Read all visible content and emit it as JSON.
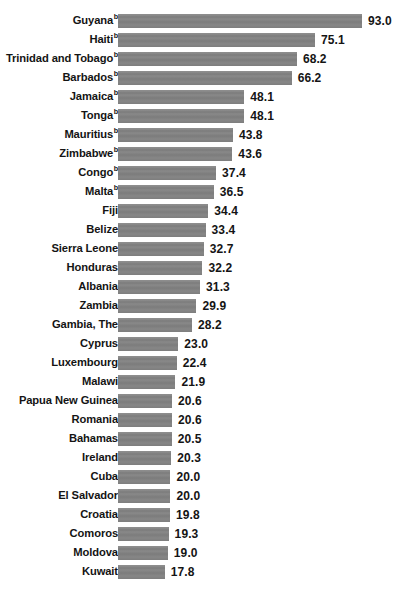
{
  "chart_data": {
    "type": "bar",
    "orientation": "horizontal",
    "title": "",
    "subtitle": "",
    "xlabel": "",
    "ylabel": "",
    "grid": false,
    "legend": null,
    "xlim": [
      0,
      93.0
    ],
    "value_format": "one-decimal",
    "bar_color": "#808080",
    "label_color": "#141414",
    "footnote_marker": "b",
    "categories": [
      "Guyana",
      "Haiti",
      "Trinidad and Tobago",
      "Barbados",
      "Jamaica",
      "Tonga",
      "Mauritius",
      "Zimbabwe",
      "Congo",
      "Malta",
      "Fiji",
      "Belize",
      "Sierra Leone",
      "Honduras",
      "Albania",
      "Zambia",
      "Gambia, The",
      "Cyprus",
      "Luxembourg",
      "Malawi",
      "Papua New Guinea",
      "Romania",
      "Bahamas",
      "Ireland",
      "Cuba",
      "El Salvador",
      "Croatia",
      "Comoros",
      "Moldova",
      "Kuwait"
    ],
    "values": [
      93.0,
      75.1,
      68.2,
      66.2,
      48.1,
      48.1,
      43.8,
      43.6,
      37.4,
      36.5,
      34.4,
      33.4,
      32.7,
      32.2,
      31.3,
      29.9,
      28.2,
      23.0,
      22.4,
      21.9,
      20.6,
      20.6,
      20.5,
      20.3,
      20.0,
      20.0,
      19.8,
      19.3,
      19.0,
      17.8
    ],
    "marked": [
      true,
      true,
      true,
      true,
      true,
      true,
      true,
      true,
      true,
      true,
      false,
      false,
      false,
      false,
      false,
      false,
      false,
      false,
      false,
      false,
      false,
      false,
      false,
      false,
      false,
      false,
      false,
      false,
      false,
      false
    ],
    "rows": [
      {
        "label": "Guyana",
        "value": 93.0,
        "value_text": "93.0",
        "marker": "b"
      },
      {
        "label": "Haiti",
        "value": 75.1,
        "value_text": "75.1",
        "marker": "b"
      },
      {
        "label": "Trinidad and Tobago",
        "value": 68.2,
        "value_text": "68.2",
        "marker": "b"
      },
      {
        "label": "Barbados",
        "value": 66.2,
        "value_text": "66.2",
        "marker": "b"
      },
      {
        "label": "Jamaica",
        "value": 48.1,
        "value_text": "48.1",
        "marker": "b"
      },
      {
        "label": "Tonga",
        "value": 48.1,
        "value_text": "48.1",
        "marker": "b"
      },
      {
        "label": "Mauritius",
        "value": 43.8,
        "value_text": "43.8",
        "marker": "b"
      },
      {
        "label": "Zimbabwe",
        "value": 43.6,
        "value_text": "43.6",
        "marker": "b"
      },
      {
        "label": "Congo",
        "value": 37.4,
        "value_text": "37.4",
        "marker": "b"
      },
      {
        "label": "Malta",
        "value": 36.5,
        "value_text": "36.5",
        "marker": "b"
      },
      {
        "label": "Fiji",
        "value": 34.4,
        "value_text": "34.4",
        "marker": ""
      },
      {
        "label": "Belize",
        "value": 33.4,
        "value_text": "33.4",
        "marker": ""
      },
      {
        "label": "Sierra Leone",
        "value": 32.7,
        "value_text": "32.7",
        "marker": ""
      },
      {
        "label": "Honduras",
        "value": 32.2,
        "value_text": "32.2",
        "marker": ""
      },
      {
        "label": "Albania",
        "value": 31.3,
        "value_text": "31.3",
        "marker": ""
      },
      {
        "label": "Zambia",
        "value": 29.9,
        "value_text": "29.9",
        "marker": ""
      },
      {
        "label": "Gambia, The",
        "value": 28.2,
        "value_text": "28.2",
        "marker": ""
      },
      {
        "label": "Cyprus",
        "value": 23.0,
        "value_text": "23.0",
        "marker": ""
      },
      {
        "label": "Luxembourg",
        "value": 22.4,
        "value_text": "22.4",
        "marker": ""
      },
      {
        "label": "Malawi",
        "value": 21.9,
        "value_text": "21.9",
        "marker": ""
      },
      {
        "label": "Papua New Guinea",
        "value": 20.6,
        "value_text": "20.6",
        "marker": ""
      },
      {
        "label": "Romania",
        "value": 20.6,
        "value_text": "20.6",
        "marker": ""
      },
      {
        "label": "Bahamas",
        "value": 20.5,
        "value_text": "20.5",
        "marker": ""
      },
      {
        "label": "Ireland",
        "value": 20.3,
        "value_text": "20.3",
        "marker": ""
      },
      {
        "label": "Cuba",
        "value": 20.0,
        "value_text": "20.0",
        "marker": ""
      },
      {
        "label": "El Salvador",
        "value": 20.0,
        "value_text": "20.0",
        "marker": ""
      },
      {
        "label": "Croatia",
        "value": 19.8,
        "value_text": "19.8",
        "marker": ""
      },
      {
        "label": "Comoros",
        "value": 19.3,
        "value_text": "19.3",
        "marker": ""
      },
      {
        "label": "Moldova",
        "value": 19.0,
        "value_text": "19.0",
        "marker": ""
      },
      {
        "label": "Kuwait",
        "value": 17.8,
        "value_text": "17.8",
        "marker": ""
      }
    ]
  },
  "layout": {
    "bar_origin_px": 118,
    "px_per_unit": 2.623,
    "row_pitch_px": 19,
    "bar_height_px": 14,
    "value_gap_px": 6
  }
}
